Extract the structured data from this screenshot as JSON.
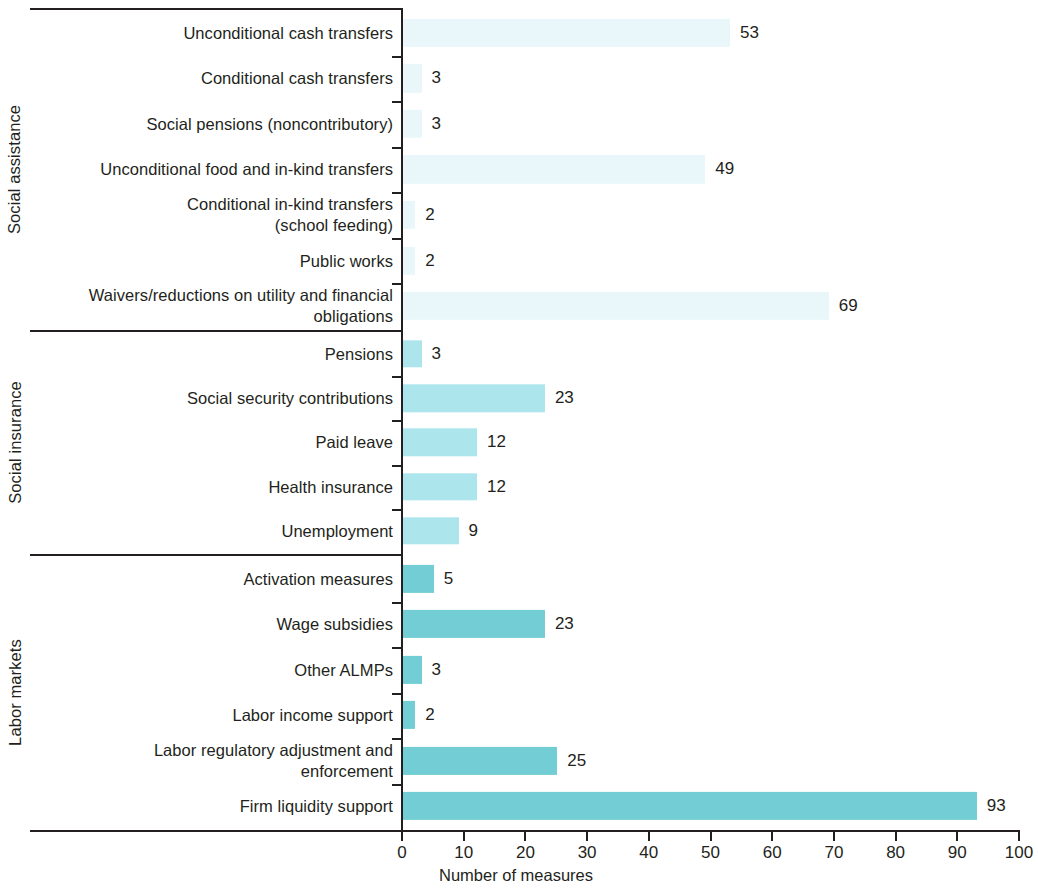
{
  "chart_data": {
    "type": "bar",
    "orientation": "horizontal",
    "title": "",
    "xlabel": "Number of measures",
    "ylabel": "",
    "xlim": [
      0,
      100
    ],
    "xticks": [
      0,
      10,
      20,
      30,
      40,
      50,
      60,
      70,
      80,
      90,
      100
    ],
    "grid": false,
    "legend": false,
    "groups": [
      {
        "name": "Social assistance",
        "color": "#eaf7fa",
        "categories": [
          "Unconditional cash transfers",
          "Conditional cash transfers",
          "Social pensions (noncontributory)",
          "Unconditional food and in-kind transfers",
          "Conditional in-kind transfers (school feeding)",
          "Public works",
          "Waivers/reductions on utility and financial obligations"
        ],
        "values": [
          53,
          3,
          3,
          49,
          2,
          2,
          69
        ]
      },
      {
        "name": "Social insurance",
        "color": "#ade5ec",
        "categories": [
          "Pensions",
          "Social security contributions",
          "Paid leave",
          "Health insurance",
          "Unemployment"
        ],
        "values": [
          3,
          23,
          12,
          12,
          9
        ]
      },
      {
        "name": "Labor markets",
        "color": "#72cdd4",
        "categories": [
          "Activation measures",
          "Wage subsidies",
          "Other ALMPs",
          "Labor income support",
          "Labor regulatory adjustment and enforcement",
          "Firm liquidity support"
        ],
        "values": [
          5,
          23,
          3,
          2,
          25,
          93
        ]
      }
    ],
    "categories": [
      "Unconditional cash transfers",
      "Conditional cash transfers",
      "Social pensions (noncontributory)",
      "Unconditional food and in-kind transfers",
      "Conditional in-kind transfers (school feeding)",
      "Public works",
      "Waivers/reductions on utility and financial obligations",
      "Pensions",
      "Social security contributions",
      "Paid leave",
      "Health insurance",
      "Unemployment",
      "Activation measures",
      "Wage subsidies",
      "Other ALMPs",
      "Labor income support",
      "Labor regulatory adjustment and enforcement",
      "Firm liquidity support"
    ],
    "values": [
      53,
      3,
      3,
      49,
      2,
      2,
      69,
      3,
      23,
      12,
      12,
      9,
      5,
      23,
      3,
      2,
      25,
      93
    ]
  },
  "rows": [
    {
      "group": 0,
      "label_lines": [
        "Unconditional cash transfers"
      ],
      "value": 53
    },
    {
      "group": 0,
      "label_lines": [
        "Conditional cash transfers"
      ],
      "value": 3
    },
    {
      "group": 0,
      "label_lines": [
        "Social pensions (noncontributory)"
      ],
      "value": 3
    },
    {
      "group": 0,
      "label_lines": [
        "Unconditional food and in-kind transfers"
      ],
      "value": 49
    },
    {
      "group": 0,
      "label_lines": [
        "Conditional in-kind transfers",
        "(school feeding)"
      ],
      "value": 2
    },
    {
      "group": 0,
      "label_lines": [
        "Public works"
      ],
      "value": 2
    },
    {
      "group": 0,
      "label_lines": [
        "Waivers/reductions on utility and financial",
        "obligations"
      ],
      "value": 69
    },
    {
      "group": 1,
      "label_lines": [
        "Pensions"
      ],
      "value": 3
    },
    {
      "group": 1,
      "label_lines": [
        "Social security contributions"
      ],
      "value": 23
    },
    {
      "group": 1,
      "label_lines": [
        "Paid leave"
      ],
      "value": 12
    },
    {
      "group": 1,
      "label_lines": [
        "Health insurance"
      ],
      "value": 12
    },
    {
      "group": 1,
      "label_lines": [
        "Unemployment"
      ],
      "value": 9
    },
    {
      "group": 2,
      "label_lines": [
        "Activation measures"
      ],
      "value": 5
    },
    {
      "group": 2,
      "label_lines": [
        "Wage subsidies"
      ],
      "value": 23
    },
    {
      "group": 2,
      "label_lines": [
        "Other ALMPs"
      ],
      "value": 3
    },
    {
      "group": 2,
      "label_lines": [
        "Labor income support"
      ],
      "value": 2
    },
    {
      "group": 2,
      "label_lines": [
        "Labor regulatory adjustment and",
        "enforcement"
      ],
      "value": 25
    },
    {
      "group": 2,
      "label_lines": [
        "Firm liquidity support"
      ],
      "value": 93
    }
  ],
  "axis": {
    "title": "Number of measures",
    "ticks": [
      "0",
      "10",
      "20",
      "30",
      "40",
      "50",
      "60",
      "70",
      "80",
      "90",
      "100"
    ]
  },
  "group_titles": [
    "Social assistance",
    "Social insurance",
    "Labor markets"
  ],
  "colors": {
    "social_assistance": "#eaf7fa",
    "social_insurance": "#ade5ec",
    "labor_markets": "#72cdd4",
    "ink": "#231f20",
    "background": "#ffffff"
  }
}
